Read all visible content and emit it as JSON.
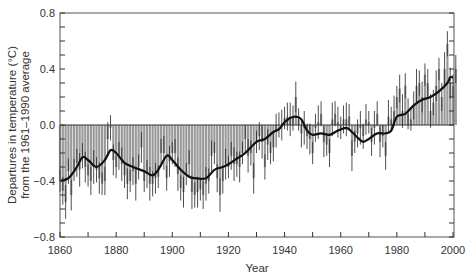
{
  "chart_data": {
    "type": "bar",
    "title": "",
    "xlabel": "Year",
    "ylabel": [
      "Departures in temperature (°C)",
      "from the 1961–1990 average"
    ],
    "xlim": [
      1860,
      2002
    ],
    "ylim": [
      -0.8,
      0.8
    ],
    "x_ticks": [
      1860,
      1880,
      1900,
      1920,
      1940,
      1960,
      1980,
      2000
    ],
    "x_tick_labels": [
      "1860",
      "1880",
      "1900",
      "1920",
      "1940",
      "1960",
      "1980",
      "2000"
    ],
    "y_ticks": [
      0.8,
      0.4,
      0.0,
      -0.4,
      -0.8
    ],
    "y_tick_labels": [
      "0.8",
      "0.4",
      "0.0",
      "−0.4",
      "−0.8"
    ],
    "grid": false,
    "legend": null,
    "series": [
      {
        "name": "Annual anomaly (bars with error bars)",
        "style": "grey vertical bars from zero with black error bars",
        "x": [
          1860,
          1861,
          1862,
          1863,
          1864,
          1865,
          1866,
          1867,
          1868,
          1869,
          1870,
          1871,
          1872,
          1873,
          1874,
          1875,
          1876,
          1877,
          1878,
          1879,
          1880,
          1881,
          1882,
          1883,
          1884,
          1885,
          1886,
          1887,
          1888,
          1889,
          1890,
          1891,
          1892,
          1893,
          1894,
          1895,
          1896,
          1897,
          1898,
          1899,
          1900,
          1901,
          1902,
          1903,
          1904,
          1905,
          1906,
          1907,
          1908,
          1909,
          1910,
          1911,
          1912,
          1913,
          1914,
          1915,
          1916,
          1917,
          1918,
          1919,
          1920,
          1921,
          1922,
          1923,
          1924,
          1925,
          1926,
          1927,
          1928,
          1929,
          1930,
          1931,
          1932,
          1933,
          1934,
          1935,
          1936,
          1937,
          1938,
          1939,
          1940,
          1941,
          1942,
          1943,
          1944,
          1945,
          1946,
          1947,
          1948,
          1949,
          1950,
          1951,
          1952,
          1953,
          1954,
          1955,
          1956,
          1957,
          1958,
          1959,
          1960,
          1961,
          1962,
          1963,
          1964,
          1965,
          1966,
          1967,
          1968,
          1969,
          1970,
          1971,
          1972,
          1973,
          1974,
          1975,
          1976,
          1977,
          1978,
          1979,
          1980,
          1981,
          1982,
          1983,
          1984,
          1985,
          1986,
          1987,
          1988,
          1989,
          1990,
          1991,
          1992,
          1993,
          1994,
          1995,
          1996,
          1997,
          1998,
          1999,
          2000,
          2001
        ],
        "values": [
          -0.4,
          -0.47,
          -0.55,
          -0.33,
          -0.5,
          -0.32,
          -0.27,
          -0.32,
          -0.22,
          -0.3,
          -0.36,
          -0.4,
          -0.3,
          -0.32,
          -0.38,
          -0.42,
          -0.4,
          -0.1,
          -0.02,
          -0.25,
          -0.3,
          -0.22,
          -0.28,
          -0.36,
          -0.42,
          -0.4,
          -0.33,
          -0.42,
          -0.3,
          -0.16,
          -0.4,
          -0.35,
          -0.42,
          -0.42,
          -0.38,
          -0.37,
          -0.2,
          -0.2,
          -0.38,
          -0.26,
          -0.2,
          -0.2,
          -0.35,
          -0.45,
          -0.48,
          -0.35,
          -0.28,
          -0.48,
          -0.5,
          -0.48,
          -0.46,
          -0.5,
          -0.42,
          -0.4,
          -0.22,
          -0.2,
          -0.38,
          -0.5,
          -0.4,
          -0.28,
          -0.3,
          -0.22,
          -0.28,
          -0.28,
          -0.3,
          -0.2,
          -0.1,
          -0.22,
          -0.2,
          -0.38,
          -0.12,
          -0.08,
          -0.12,
          -0.3,
          -0.14,
          -0.2,
          -0.16,
          -0.04,
          0.0,
          0.0,
          0.05,
          0.06,
          0.04,
          0.05,
          0.2,
          0.04,
          -0.06,
          -0.02,
          -0.08,
          -0.1,
          -0.2,
          -0.02,
          0.02,
          0.08,
          -0.12,
          -0.14,
          -0.2,
          0.04,
          0.08,
          0.02,
          -0.02,
          0.04,
          0.04,
          0.06,
          -0.22,
          -0.12,
          -0.06,
          -0.02,
          -0.08,
          0.04,
          0.02,
          -0.12,
          -0.02,
          0.08,
          -0.12,
          -0.08,
          -0.22,
          0.06,
          0.04,
          0.1,
          0.2,
          0.26,
          0.1,
          0.28,
          0.08,
          0.04,
          0.14,
          0.28,
          0.3,
          0.2,
          0.36,
          0.3,
          0.1,
          0.16,
          0.28,
          0.4,
          0.2,
          0.4,
          0.58,
          0.3,
          0.28,
          0.4
        ]
      },
      {
        "name": "Smoothed curve",
        "style": "thick black line",
        "x": [
          1860,
          1863,
          1866,
          1868,
          1870,
          1873,
          1876,
          1878,
          1880,
          1883,
          1886,
          1890,
          1893,
          1895,
          1898,
          1900,
          1903,
          1906,
          1908,
          1912,
          1915,
          1918,
          1920,
          1923,
          1926,
          1930,
          1933,
          1936,
          1938,
          1940,
          1942,
          1944,
          1946,
          1948,
          1950,
          1953,
          1956,
          1959,
          1962,
          1964,
          1966,
          1968,
          1970,
          1973,
          1976,
          1978,
          1980,
          1983,
          1986,
          1989,
          1992,
          1995,
          1998,
          1999,
          2000
        ],
        "values": [
          -0.4,
          -0.38,
          -0.3,
          -0.23,
          -0.25,
          -0.3,
          -0.25,
          -0.18,
          -0.2,
          -0.27,
          -0.3,
          -0.33,
          -0.36,
          -0.32,
          -0.22,
          -0.25,
          -0.32,
          -0.37,
          -0.38,
          -0.38,
          -0.32,
          -0.3,
          -0.28,
          -0.24,
          -0.2,
          -0.12,
          -0.1,
          -0.05,
          -0.03,
          0.02,
          0.05,
          0.06,
          0.04,
          -0.04,
          -0.07,
          -0.06,
          -0.07,
          -0.04,
          -0.02,
          -0.05,
          -0.09,
          -0.12,
          -0.1,
          -0.06,
          -0.06,
          -0.04,
          0.06,
          0.08,
          0.14,
          0.18,
          0.2,
          0.24,
          0.3,
          0.34,
          0.34
        ]
      }
    ]
  }
}
